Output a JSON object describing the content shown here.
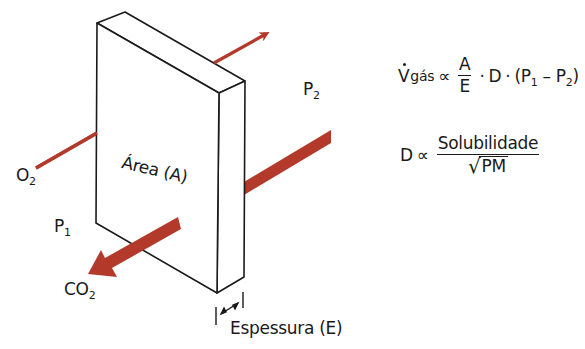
{
  "colors": {
    "arrow": "#b3392b",
    "outline": "#1a1a1a",
    "background": "#ffffff"
  },
  "slab": {
    "area_label": "Área (A)",
    "thickness_label": "Espessura (E)"
  },
  "labels": {
    "o2": "O",
    "o2_sub": "2",
    "co2": "CO",
    "co2_sub": "2",
    "p1": "P",
    "p1_sub": "1",
    "p2": "P",
    "p2_sub": "2"
  },
  "equation1": {
    "lhs": "V",
    "lhs_sub": "gás",
    "proportional": "∝",
    "frac_num": "A",
    "frac_den": "E",
    "dot1": "·",
    "d": "D",
    "dot2": "·",
    "paren_open": "(P",
    "p1_sub": "1",
    "minus": " – P",
    "p2_sub": "2",
    "paren_close": ")"
  },
  "equation2": {
    "lhs": "D",
    "proportional": "∝",
    "frac_num": "Solubilidade",
    "sqrt_symbol": "√",
    "frac_den": "PM"
  },
  "arrows": [
    {
      "name": "o2-diffusion-line",
      "gas": "O2",
      "direction": "into slab"
    },
    {
      "name": "o2-exit-arrow",
      "gas": "O2",
      "direction": "out to P2 side"
    },
    {
      "name": "co2-entry-band",
      "gas": "CO2",
      "direction": "from P2 side"
    },
    {
      "name": "co2-exit-arrow",
      "gas": "CO2",
      "direction": "out to P1 side"
    }
  ]
}
